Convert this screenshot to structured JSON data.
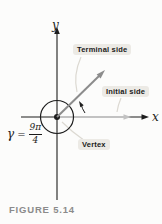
{
  "figure": {
    "caption": "FIGURE 5.14"
  },
  "axes": {
    "x_label": "x",
    "y_label": "y"
  },
  "annotations": {
    "terminal_side": "Terminal side",
    "initial_side": "Initial side",
    "vertex": "Vertex"
  },
  "angle_label": {
    "symbol": "γ",
    "equals": "=",
    "numerator": "9π",
    "denominator": "4"
  },
  "colors": {
    "paper": "#fcfcfb",
    "axis": "#1d1d1d",
    "terminal_ray": "#8c8c8c",
    "initial_ray": "#c2c2c2",
    "label_bg": "#eceae5",
    "leader": "#dcd9d2",
    "caption": "#8b8b8b"
  }
}
